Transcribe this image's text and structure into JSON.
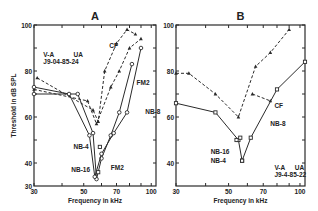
{
  "chart_data": [
    {
      "panel": "A",
      "type": "line",
      "title": "A",
      "xlabel": "Frequency in kHz",
      "ylabel": "Threshold in dB SPL",
      "xscale": "log",
      "xlim": [
        30,
        105
      ],
      "ylim": [
        30,
        100
      ],
      "xticks": [
        30,
        50,
        70,
        100
      ],
      "yticks": [
        30,
        40,
        60,
        80,
        100
      ],
      "ytick_labels": [
        "30",
        "40",
        "60",
        "80",
        "100"
      ],
      "annotations": [
        {
          "text": "V-A",
          "x": 33,
          "y": 86
        },
        {
          "text": "UA",
          "x": 45,
          "y": 86
        },
        {
          "text": "J9-04-85-24",
          "x": 33,
          "y": 83
        }
      ],
      "series": [
        {
          "name": "CF",
          "style": "dashed",
          "marker": "triangle",
          "x": [
            31,
            55,
            58,
            62,
            70,
            78,
            85
          ],
          "y": [
            77,
            63,
            58,
            80,
            92,
            98,
            96
          ]
        },
        {
          "name": "CF-lower",
          "style": "dashed",
          "marker": "triangle",
          "x": [
            30,
            52,
            57,
            66,
            72,
            80,
            90
          ],
          "y": [
            72,
            67,
            57,
            73,
            80,
            90,
            94
          ]
        },
        {
          "name": "FM2",
          "style": "solid",
          "marker": "circle",
          "x": [
            30,
            47,
            55,
            57,
            60,
            66,
            72,
            82
          ],
          "y": [
            70,
            70,
            53,
            33,
            42,
            52,
            62,
            83
          ]
        },
        {
          "name": "NB-8",
          "style": "solid",
          "marker": "circle",
          "x": [
            30,
            43,
            53,
            56,
            60,
            68,
            78,
            90
          ],
          "y": [
            73,
            70,
            52,
            34,
            44,
            53,
            62,
            90
          ]
        },
        {
          "name": "NB-4",
          "style": "dashed",
          "marker": "square",
          "x": [
            59
          ],
          "y": [
            47
          ]
        },
        {
          "name": "NB-16",
          "style": "solid",
          "marker": "square",
          "x": [
            58
          ],
          "y": [
            36
          ]
        }
      ],
      "labels": [
        {
          "text": "CF",
          "x": 65,
          "y": 91
        },
        {
          "text": "FM2",
          "x": 86,
          "y": 75
        },
        {
          "text": "NB-8",
          "x": 94,
          "y": 62
        },
        {
          "text": "NB-4",
          "x": 45,
          "y": 47
        },
        {
          "text": "NB-16",
          "x": 44,
          "y": 37
        },
        {
          "text": "FM2",
          "x": 66,
          "y": 38
        }
      ]
    },
    {
      "panel": "B",
      "type": "line",
      "title": "B",
      "xlabel": "Frequency in kHz",
      "ylabel": "",
      "xscale": "log",
      "xlim": [
        30,
        105
      ],
      "ylim": [
        30,
        100
      ],
      "xticks": [
        30,
        50,
        70,
        100
      ],
      "yticks": [
        40,
        60,
        80,
        100
      ],
      "ytick_labels": [
        "40",
        "60",
        "80",
        "100"
      ],
      "annotations": [
        {
          "text": "V-A",
          "x": 78,
          "y": 37
        },
        {
          "text": "UA",
          "x": 95,
          "y": 37
        },
        {
          "text": "J9-4-85-22",
          "x": 78,
          "y": 34
        }
      ],
      "series": [
        {
          "name": "CF",
          "style": "dashed",
          "marker": "triangle",
          "x": [
            30,
            34,
            44,
            55,
            65,
            75,
            90
          ],
          "y": [
            79,
            79,
            70,
            60,
            82,
            88,
            98
          ]
        },
        {
          "name": "CF-branch",
          "style": "dashed",
          "marker": "triangle",
          "x": [
            63,
            75
          ],
          "y": [
            70,
            67
          ]
        },
        {
          "name": "NB-8",
          "style": "solid",
          "marker": "square",
          "x": [
            30,
            44,
            55,
            57,
            62,
            80,
            105
          ],
          "y": [
            66,
            62,
            50,
            41,
            51,
            72,
            84
          ]
        },
        {
          "name": "NB-16",
          "style": "solid",
          "marker": "square",
          "x": [
            54,
            56
          ],
          "y": [
            50,
            51
          ]
        },
        {
          "name": "NB-4",
          "style": "solid",
          "marker": "square",
          "x": [
            57
          ],
          "y": [
            41
          ]
        }
      ],
      "labels": [
        {
          "text": "CF",
          "x": 78,
          "y": 65
        },
        {
          "text": "NB-8",
          "x": 75,
          "y": 57
        },
        {
          "text": "NB-16",
          "x": 42,
          "y": 45
        },
        {
          "text": "NB-4",
          "x": 42,
          "y": 41
        }
      ]
    }
  ],
  "panels": {
    "A": {
      "title": "A",
      "xlabel": "Frequency in kHz",
      "ylabel": "Threshold in dB SPL"
    },
    "B": {
      "title": "B",
      "xlabel": "Frequency in kHz"
    }
  }
}
